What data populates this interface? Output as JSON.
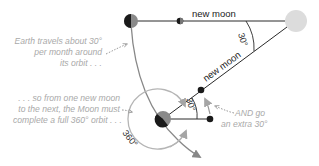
{
  "diagram": {
    "colors": {
      "earth_dark": "#1a1a1a",
      "earth_light": "#8a8a8a",
      "sun": "#dcdcdc",
      "line": "#2a2a2a",
      "orbit": "#888888",
      "moon_orbit": "#b5b5b5",
      "note_text": "#a9a9a9"
    },
    "labels": {
      "new_moon_top": "new moon",
      "new_moon_diag": "new moon",
      "angle_sun": "30°",
      "angle_earth": "30°",
      "angle_full": "360°"
    },
    "notes": {
      "earth_travel": [
        "Earth travels about 30°",
        "per month around",
        "its orbit . . ."
      ],
      "full_orbit": [
        ". . . so from one new moon",
        "to the next, the Moon must",
        "complete a full 360° orbit . . ."
      ],
      "extra": [
        "AND go",
        "an extra 30°"
      ]
    }
  }
}
